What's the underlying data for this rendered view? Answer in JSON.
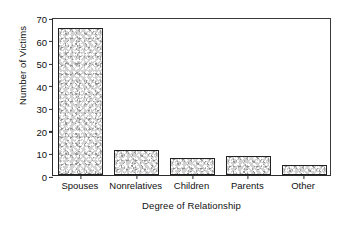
{
  "chart_data": {
    "type": "bar",
    "title": "",
    "xlabel": "Degree of Relationship",
    "ylabel": "Number of Victims",
    "categories": [
      "Spouses",
      "Nonrelatives",
      "Children",
      "Parents",
      "Other"
    ],
    "values": [
      65,
      11,
      7.5,
      8.5,
      4.5
    ],
    "ylim": [
      0,
      70
    ],
    "yticks": [
      0,
      10,
      20,
      30,
      40,
      50,
      60,
      70
    ],
    "ytick_labels": [
      "0",
      "10",
      "20",
      "30",
      "40",
      "50",
      "60",
      "70"
    ],
    "grid": false,
    "legend": null,
    "bar_fill_color": "#d2d2d2",
    "bar_edge_color": "#222222",
    "axis_color": "#2b2b2b",
    "background_color": "#ffffff"
  }
}
